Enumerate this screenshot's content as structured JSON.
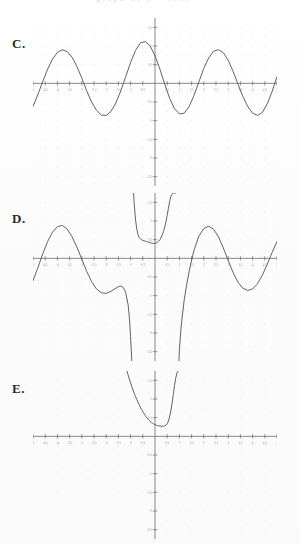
{
  "document": {
    "kind": "multiple-choice-graph-figure",
    "clipped_header_text": "graph of y = f(x)",
    "panels": [
      {
        "id": "C",
        "label": "C."
      },
      {
        "id": "D",
        "label": "D."
      },
      {
        "id": "E",
        "label": "E."
      }
    ]
  },
  "axes": {
    "x_ticks": [
      "-5",
      "-4.5",
      "-4",
      "-3.5",
      "-3",
      "-2.5",
      "-2",
      "-1.5",
      "-1",
      "-0.5",
      "0",
      "0.5",
      "1",
      "1.5",
      "2",
      "2.5",
      "3",
      "3.5",
      "4",
      "4.5",
      "5"
    ],
    "x_tick_values": [
      -5,
      -4.5,
      -4,
      -3.5,
      -3,
      -2.5,
      -2,
      -1.5,
      -1,
      -0.5,
      0,
      0.5,
      1,
      1.5,
      2,
      2.5,
      3,
      3.5,
      4,
      4.5,
      5
    ],
    "y_ticks": [
      "1.5",
      "1",
      "0.5",
      "-0.5",
      "-1",
      "-1.5",
      "-2",
      "-2.5"
    ],
    "y_tick_values": [
      1.5,
      1,
      0.5,
      -0.5,
      -1,
      -1.5,
      -2,
      -2.5
    ],
    "xlim": [
      -5,
      5
    ],
    "ylim": [
      -2.75,
      1.75
    ],
    "grid": "dotted",
    "axis_color": "#6b6b6b",
    "curve_color": "#5a5a5a",
    "grid_color": "#e9e9ee"
  },
  "chart_data": [
    {
      "type": "line",
      "panel": "C",
      "title": "C.",
      "xlabel": "",
      "ylabel": "",
      "xlim": [
        -5,
        5
      ],
      "ylim": [
        -2.75,
        1.75
      ],
      "grid": true,
      "legend": "none",
      "description": "Smooth sinusoid, amplitude about 1, period about 4, crossing upward near x = -5 and peaking near x = -4, -0.6 and 2.8.",
      "series": [
        {
          "name": "sine-wave",
          "x": [
            -5.0,
            -4.8,
            -4.6,
            -4.4,
            -4.2,
            -4.0,
            -3.8,
            -3.6,
            -3.4,
            -3.2,
            -3.0,
            -2.8,
            -2.6,
            -2.4,
            -2.2,
            -2.0,
            -1.8,
            -1.6,
            -1.4,
            -1.2,
            -1.0,
            -0.8,
            -0.6,
            -0.4,
            -0.2,
            0.0,
            0.2,
            0.4,
            0.6,
            0.8,
            1.0,
            1.2,
            1.4,
            1.6,
            1.8,
            2.0,
            2.2,
            2.4,
            2.6,
            2.8,
            3.0,
            3.2,
            3.4,
            3.6,
            3.8,
            4.0,
            4.2,
            4.4,
            4.6,
            4.8,
            5.0
          ],
          "y": [
            -0.62,
            -0.3,
            0.05,
            0.38,
            0.65,
            0.83,
            0.9,
            0.85,
            0.7,
            0.45,
            0.14,
            -0.2,
            -0.5,
            -0.72,
            -0.85,
            -0.86,
            -0.75,
            -0.52,
            -0.2,
            0.18,
            0.56,
            0.88,
            1.08,
            1.12,
            1.0,
            0.74,
            0.38,
            -0.02,
            -0.4,
            -0.68,
            -0.82,
            -0.8,
            -0.62,
            -0.32,
            0.04,
            0.4,
            0.68,
            0.86,
            0.9,
            0.82,
            0.62,
            0.32,
            -0.02,
            -0.35,
            -0.62,
            -0.8,
            -0.86,
            -0.78,
            -0.55,
            -0.22,
            0.18
          ]
        }
      ]
    },
    {
      "type": "line",
      "panel": "D",
      "title": "D.",
      "xlabel": "",
      "ylabel": "",
      "xlim": [
        -5,
        5
      ],
      "ylim": [
        -2.75,
        1.75
      ],
      "grid": true,
      "legend": "none",
      "description": "Oscillating curve with two vertical asymptotes near x = -0.9 and x = 0.9; between them a U-shaped branch opening upward with minimum near (0.1, 0.45); outside, damped sine-like arcs plunging to minus infinity at the asymptotes.",
      "series": [
        {
          "name": "left-branch",
          "x": [
            -5.0,
            -4.8,
            -4.6,
            -4.4,
            -4.2,
            -4.0,
            -3.8,
            -3.6,
            -3.4,
            -3.2,
            -3.0,
            -2.8,
            -2.6,
            -2.4,
            -2.2,
            -2.0,
            -1.8,
            -1.6,
            -1.5,
            -1.4,
            -1.3,
            -1.2,
            -1.1,
            -1.05,
            -1.0,
            -0.97,
            -0.95
          ],
          "y": [
            -0.6,
            -0.25,
            0.12,
            0.45,
            0.7,
            0.85,
            0.88,
            0.78,
            0.58,
            0.3,
            -0.02,
            -0.35,
            -0.62,
            -0.82,
            -0.92,
            -0.94,
            -0.88,
            -0.8,
            -0.76,
            -0.74,
            -0.78,
            -0.92,
            -1.25,
            -1.6,
            -2.1,
            -2.5,
            -2.75
          ]
        },
        {
          "name": "middle-branch",
          "x": [
            -0.88,
            -0.85,
            -0.8,
            -0.75,
            -0.7,
            -0.65,
            -0.6,
            -0.55,
            -0.5,
            -0.45,
            -0.4,
            -0.35,
            -0.3,
            -0.25,
            -0.2,
            -0.15,
            -0.1,
            -0.05,
            0.0,
            0.05,
            0.1,
            0.15,
            0.2,
            0.25,
            0.3,
            0.35,
            0.4,
            0.45,
            0.5,
            0.55,
            0.6,
            0.65,
            0.7,
            0.75,
            0.8,
            0.85
          ],
          "y": [
            1.75,
            1.45,
            1.05,
            0.8,
            0.64,
            0.56,
            0.52,
            0.5,
            0.48,
            0.47,
            0.46,
            0.45,
            0.44,
            0.43,
            0.42,
            0.41,
            0.4,
            0.4,
            0.4,
            0.41,
            0.43,
            0.46,
            0.5,
            0.56,
            0.63,
            0.72,
            0.84,
            0.98,
            1.15,
            1.34,
            1.52,
            1.66,
            1.72,
            1.75,
            1.75,
            1.75
          ]
        },
        {
          "name": "right-branch",
          "x": [
            0.98,
            1.0,
            1.05,
            1.1,
            1.2,
            1.3,
            1.4,
            1.5,
            1.6,
            1.8,
            2.0,
            2.2,
            2.4,
            2.6,
            2.8,
            3.0,
            3.2,
            3.4,
            3.6,
            3.8,
            4.0,
            4.2,
            4.4,
            4.6,
            4.8,
            5.0
          ],
          "y": [
            -2.75,
            -2.45,
            -2.0,
            -1.65,
            -1.1,
            -0.7,
            -0.35,
            -0.05,
            0.22,
            0.6,
            0.8,
            0.86,
            0.78,
            0.58,
            0.28,
            -0.06,
            -0.38,
            -0.64,
            -0.8,
            -0.86,
            -0.82,
            -0.68,
            -0.45,
            -0.16,
            0.16,
            0.45
          ]
        }
      ]
    },
    {
      "type": "line",
      "panel": "E",
      "title": "E.",
      "xlabel": "",
      "ylabel": "",
      "xlim": [
        -5,
        5
      ],
      "ylim": [
        -2.75,
        1.75
      ],
      "grid": true,
      "legend": "none",
      "description": "Single steep U-shaped branch confined near the origin; descends from upper-left near x = -1.2, reaches a minimum about (0.45, 0.30), then rises almost vertically near x = 1.",
      "series": [
        {
          "name": "u-branch",
          "x": [
            -1.15,
            -1.1,
            -1.05,
            -1.0,
            -0.95,
            -0.9,
            -0.85,
            -0.8,
            -0.75,
            -0.7,
            -0.65,
            -0.6,
            -0.55,
            -0.5,
            -0.45,
            -0.4,
            -0.35,
            -0.3,
            -0.25,
            -0.2,
            -0.15,
            -0.1,
            -0.05,
            0.0,
            0.05,
            0.1,
            0.15,
            0.2,
            0.25,
            0.3,
            0.35,
            0.4,
            0.45,
            0.5,
            0.55,
            0.6,
            0.65,
            0.7,
            0.75,
            0.8,
            0.85,
            0.9,
            0.95
          ],
          "y": [
            1.75,
            1.64,
            1.53,
            1.43,
            1.33,
            1.24,
            1.15,
            1.07,
            0.99,
            0.92,
            0.85,
            0.78,
            0.72,
            0.66,
            0.61,
            0.56,
            0.51,
            0.47,
            0.43,
            0.4,
            0.37,
            0.35,
            0.33,
            0.31,
            0.3,
            0.29,
            0.28,
            0.28,
            0.27,
            0.27,
            0.27,
            0.28,
            0.3,
            0.34,
            0.41,
            0.52,
            0.68,
            0.89,
            1.12,
            1.36,
            1.56,
            1.7,
            1.75
          ]
        }
      ]
    }
  ]
}
